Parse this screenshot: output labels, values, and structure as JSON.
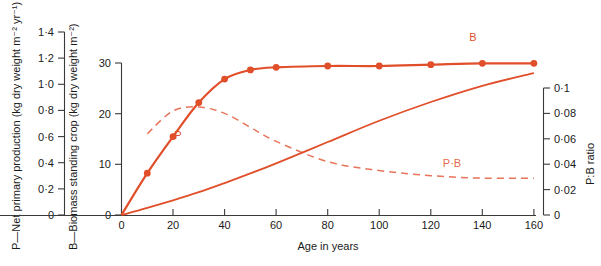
{
  "chart_data": {
    "type": "line",
    "title": "",
    "xlabel": "Age in years",
    "xlim": [
      0,
      160
    ],
    "xticks": [
      0,
      20,
      40,
      60,
      80,
      100,
      120,
      140,
      160
    ],
    "xticklabels": [
      "0",
      "20",
      "40",
      "60",
      "80",
      "100",
      "120",
      "140",
      "160"
    ],
    "grid": false,
    "legend_position": "inline-annotations",
    "axes": [
      {
        "id": "p",
        "side": "left-outer",
        "label": "P—Net primary production (kg dry weight m⁻² yr⁻¹)",
        "lim": [
          0,
          1.4
        ],
        "ticks": [
          0,
          0.2,
          0.4,
          0.6,
          0.8,
          1.0,
          1.2,
          1.4
        ],
        "ticklabels": [
          "0",
          "0·2",
          "0·4",
          "0·6",
          "0·8",
          "1·0",
          "1·2",
          "1·4"
        ]
      },
      {
        "id": "b",
        "side": "left-inner",
        "label": "B—Biomass standing crop (kg dry weight m⁻²)",
        "lim": [
          0,
          30
        ],
        "ticks": [
          0,
          10,
          20,
          30
        ],
        "ticklabels": [
          "0",
          "10",
          "20",
          "30"
        ]
      },
      {
        "id": "pb",
        "side": "right",
        "label": "P:B ratio",
        "lim": [
          0,
          0.1
        ],
        "ticks": [
          0,
          0.02,
          0.04,
          0.06,
          0.08,
          0.1
        ],
        "ticklabels": [
          "0",
          "0·02",
          "0·04",
          "0·06",
          "0·08",
          "0·1"
        ]
      }
    ],
    "x": [
      0,
      10,
      20,
      30,
      40,
      50,
      60,
      80,
      100,
      120,
      140,
      160
    ],
    "series": [
      {
        "name": "P",
        "axis": "p",
        "annotation": "P",
        "style": "solid-with-markers",
        "color": "#E04E2A",
        "unit": "kg dry weight m⁻² yr⁻¹",
        "values": [
          0,
          0.32,
          0.6,
          0.86,
          1.04,
          1.11,
          1.13,
          1.14,
          1.14,
          1.15,
          1.16,
          1.16
        ]
      },
      {
        "name": "B",
        "axis": "b",
        "annotation": "B",
        "style": "solid",
        "color": "#E04E2A",
        "unit": "kg dry weight m⁻²",
        "values": [
          0,
          1.4,
          2.9,
          4.5,
          6.3,
          8.2,
          10.2,
          14.4,
          18.6,
          22.3,
          25.5,
          28.0
        ]
      },
      {
        "name": "P:B",
        "axis": "pb",
        "annotation": "P·B",
        "style": "dashed",
        "color": "#E04E2A",
        "unit": "ratio",
        "values": [
          null,
          0.064,
          0.082,
          0.085,
          0.08,
          0.069,
          0.058,
          0.042,
          0.035,
          0.031,
          0.029,
          0.029
        ]
      }
    ],
    "annotations": [
      {
        "text": "P",
        "series": "P",
        "x": 25,
        "y_axis": "p",
        "y": 0.62
      },
      {
        "text": "B",
        "series": "B",
        "x": 142,
        "y_axis": "b",
        "y": 29.2
      },
      {
        "text": "P·B",
        "series": "P:B",
        "x": 128,
        "y_axis": "pb",
        "y": 0.04
      }
    ]
  },
  "colors": {
    "curve": "#E04E2A",
    "axis": "#3a3a3a",
    "text": "#1a1a1a",
    "background": "#ffffff"
  }
}
